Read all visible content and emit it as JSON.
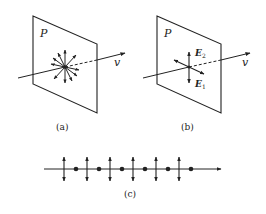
{
  "figure": {
    "panels": [
      {
        "id": "a",
        "caption": "(a)",
        "plane_label": "P",
        "velocity_label": "v",
        "description": "unpolarized light: E-field vectors in all directions within plane P"
      },
      {
        "id": "b",
        "caption": "(b)",
        "plane_label": "P",
        "velocity_label": "v",
        "field_labels": [
          {
            "symbol": "E",
            "subscript": "2"
          },
          {
            "symbol": "E",
            "subscript": "1"
          }
        ],
        "description": "decomposition into two orthogonal components E1 and E2"
      },
      {
        "id": "c",
        "caption": "(c)",
        "vertical_arrow_count": 6,
        "dot_count": 6,
        "description": "ray representation alternating dots and double-headed arrows"
      }
    ]
  },
  "colors": {
    "ink": "#222222",
    "background": "#ffffff"
  }
}
